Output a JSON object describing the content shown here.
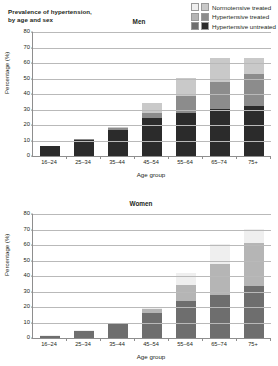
{
  "figure": {
    "title": "Prevalence of hypertension,\nby age and sex"
  },
  "legend": {
    "items": [
      {
        "label": "Normotensive treated",
        "color_men": "#c9c9c9",
        "color_women": "#efefef"
      },
      {
        "label": "Hypertensive treated",
        "color_men": "#8c8c8c",
        "color_women": "#b5b5b5"
      },
      {
        "label": "Hypertensive untreated",
        "color_men": "#2b2b2b",
        "color_women": "#6e6e6e"
      }
    ]
  },
  "axis": {
    "ylabel": "Percentage (%)",
    "xlabel": "Age group",
    "yticks": [
      0,
      10,
      20,
      30,
      40,
      50,
      60,
      70,
      80
    ]
  },
  "chart_data": [
    {
      "type": "bar",
      "stacked": true,
      "title": "Men",
      "xlabel": "Age group",
      "ylabel": "Percentage (%)",
      "ylim": [
        0,
        80
      ],
      "yticks": [
        0,
        10,
        20,
        30,
        40,
        50,
        60,
        70,
        80
      ],
      "grid": true,
      "legend_position": "top-right",
      "categories": [
        "16–24",
        "25–34",
        "35–44",
        "45–54",
        "55–64",
        "65–74",
        "75+"
      ],
      "series": [
        {
          "name": "Hypertensive untreated",
          "color": "#2b2b2b",
          "values": [
            6.5,
            10.5,
            17.0,
            24.5,
            27.5,
            30.5,
            32.5
          ]
        },
        {
          "name": "Hypertensive treated",
          "color": "#8c8c8c",
          "values": [
            0.0,
            0.3,
            1.0,
            3.5,
            11.0,
            17.0,
            20.5
          ]
        },
        {
          "name": "Normotensive treated",
          "color": "#c9c9c9",
          "values": [
            0.0,
            0.2,
            1.0,
            6.0,
            12.0,
            16.0,
            10.5
          ]
        }
      ],
      "totals": [
        6.5,
        11.0,
        19.0,
        34.0,
        50.5,
        63.5,
        63.5
      ]
    },
    {
      "type": "bar",
      "stacked": true,
      "title": "Women",
      "xlabel": "Age group",
      "ylabel": "Percentage (%)",
      "ylim": [
        0,
        80
      ],
      "yticks": [
        0,
        10,
        20,
        30,
        40,
        50,
        60,
        70,
        80
      ],
      "grid": true,
      "legend_position": "top-right",
      "categories": [
        "16–24",
        "25–34",
        "35–44",
        "45–54",
        "55–64",
        "65–74",
        "75+"
      ],
      "series": [
        {
          "name": "Hypertensive untreated",
          "color": "#6e6e6e",
          "values": [
            1.5,
            4.5,
            9.0,
            16.0,
            24.0,
            28.0,
            33.5
          ]
        },
        {
          "name": "Hypertensive treated",
          "color": "#b5b5b5",
          "values": [
            0.0,
            0.2,
            0.5,
            2.5,
            10.5,
            19.5,
            28.0
          ]
        },
        {
          "name": "Normotensive treated",
          "color": "#efefef",
          "values": [
            0.2,
            0.3,
            0.5,
            1.5,
            7.5,
            13.0,
            9.0
          ]
        }
      ],
      "totals": [
        1.7,
        5.0,
        10.0,
        20.0,
        42.0,
        60.5,
        70.5
      ]
    }
  ]
}
